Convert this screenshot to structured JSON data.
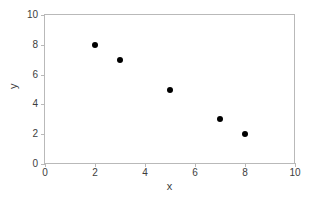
{
  "chart_data": {
    "type": "scatter",
    "title": "",
    "xlabel": "x",
    "ylabel": "y",
    "xlim": [
      0,
      10
    ],
    "ylim": [
      0,
      10
    ],
    "xticks": [
      0,
      2,
      4,
      6,
      8,
      10
    ],
    "yticks": [
      0,
      2,
      4,
      6,
      8,
      10
    ],
    "xticklabels": [
      "0",
      "2",
      "4",
      "6",
      "8",
      "10"
    ],
    "yticklabels": [
      "0",
      "2",
      "4",
      "6",
      "8",
      "10"
    ],
    "grid": false,
    "legend": null,
    "series": [
      {
        "name": "",
        "marker": "filled-circle",
        "color": "#000000",
        "points": [
          {
            "x": 2,
            "y": 8
          },
          {
            "x": 3,
            "y": 7
          },
          {
            "x": 5,
            "y": 5
          },
          {
            "x": 7,
            "y": 3
          },
          {
            "x": 8,
            "y": 2
          }
        ]
      }
    ]
  },
  "style": {
    "axis_color": "#b9b9b9",
    "text_color": "#3d3d3d",
    "marker_color": "#000000",
    "background": "#ffffff"
  }
}
